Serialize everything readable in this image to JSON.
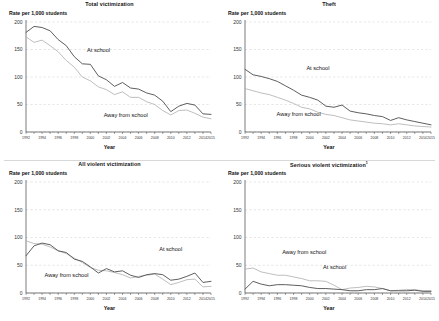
{
  "figure": {
    "series_names": [
      "At school",
      "Away from school"
    ],
    "colors": {
      "at_school": "#555555",
      "away_from_school": "#b2b2b2",
      "grid": "#cccccc",
      "axis": "#444444"
    },
    "footnote_marker": "1"
  },
  "chart_data": [
    {
      "type": "line",
      "title": "Total victimization",
      "ylabel": "Rate per 1,000 students",
      "xlabel": "Year",
      "ylim": [
        0,
        200
      ],
      "yticks": [
        0,
        50,
        100,
        150,
        200
      ],
      "grid": true,
      "legend": "inline-annotations",
      "x": [
        1992,
        1993,
        1994,
        1995,
        1996,
        1997,
        1998,
        1999,
        2000,
        2001,
        2002,
        2003,
        2004,
        2005,
        2006,
        2007,
        2008,
        2009,
        2010,
        2011,
        2012,
        2013,
        2014,
        2015
      ],
      "xticklabels": [
        "1992",
        "1994",
        "1996",
        "1998",
        "2000",
        "2002",
        "2004",
        "2006",
        "2008",
        "2010",
        "2012",
        "2014",
        "2015"
      ],
      "series": [
        {
          "name": "At school",
          "values": [
            181,
            192,
            190,
            184,
            168,
            157,
            137,
            124,
            123,
            102,
            95,
            83,
            90,
            80,
            78,
            71,
            67,
            56,
            37,
            47,
            52,
            49,
            33,
            32
          ]
        },
        {
          "name": "Away from school",
          "values": [
            173,
            163,
            167,
            157,
            146,
            130,
            118,
            100,
            93,
            82,
            77,
            68,
            73,
            63,
            63,
            55,
            50,
            39,
            31,
            39,
            40,
            34,
            27,
            24
          ]
        }
      ]
    },
    {
      "type": "line",
      "title": "Theft",
      "ylabel": "Rate per 1,000 students",
      "xlabel": "Year",
      "ylim": [
        0,
        200
      ],
      "yticks": [
        0,
        50,
        100,
        150,
        200
      ],
      "grid": true,
      "legend": "inline-annotations",
      "x": [
        1992,
        1993,
        1994,
        1995,
        1996,
        1997,
        1998,
        1999,
        2000,
        2001,
        2002,
        2003,
        2004,
        2005,
        2006,
        2007,
        2008,
        2009,
        2010,
        2011,
        2012,
        2013,
        2014,
        2015
      ],
      "xticklabels": [
        "1992",
        "1994",
        "1996",
        "1998",
        "2000",
        "2002",
        "2004",
        "2006",
        "2008",
        "2010",
        "2012",
        "2014",
        "2015"
      ],
      "series": [
        {
          "name": "At school",
          "values": [
            114,
            104,
            101,
            97,
            92,
            84,
            76,
            67,
            63,
            58,
            47,
            45,
            49,
            38,
            35,
            33,
            30,
            28,
            21,
            26,
            22,
            19,
            16,
            13
          ]
        },
        {
          "name": "Away from school",
          "values": [
            79,
            75,
            71,
            68,
            63,
            58,
            52,
            45,
            42,
            36,
            32,
            30,
            26,
            22,
            20,
            18,
            16,
            15,
            13,
            15,
            13,
            11,
            10,
            9
          ]
        }
      ]
    },
    {
      "type": "line",
      "title": "All violent victimization",
      "ylabel": "Rate per 1,000 students",
      "xlabel": "Year",
      "ylim": [
        0,
        200
      ],
      "yticks": [
        0,
        50,
        100,
        150,
        200
      ],
      "grid": true,
      "legend": "inline-annotations",
      "x": [
        1992,
        1993,
        1994,
        1995,
        1996,
        1997,
        1998,
        1999,
        2000,
        2001,
        2002,
        2003,
        2004,
        2005,
        2006,
        2007,
        2008,
        2009,
        2010,
        2011,
        2012,
        2013,
        2014,
        2015
      ],
      "xticklabels": [
        "1992",
        "1994",
        "1996",
        "1998",
        "2000",
        "2002",
        "2004",
        "2006",
        "2008",
        "2010",
        "2012",
        "2014",
        "2015"
      ],
      "series": [
        {
          "name": "At school",
          "values": [
            67,
            85,
            90,
            87,
            76,
            73,
            61,
            57,
            47,
            36,
            44,
            38,
            40,
            32,
            28,
            33,
            35,
            33,
            23,
            25,
            30,
            36,
            19,
            21
          ]
        },
        {
          "name": "Away from school",
          "values": [
            94,
            89,
            88,
            83,
            76,
            71,
            63,
            55,
            46,
            41,
            40,
            37,
            33,
            27,
            30,
            32,
            34,
            25,
            15,
            19,
            24,
            25,
            11,
            12
          ]
        }
      ]
    },
    {
      "type": "line",
      "title": "Serious violent victimization",
      "title_footnote": "1",
      "ylabel": "Rate per 1,000 students",
      "xlabel": "Year",
      "ylim": [
        0,
        200
      ],
      "yticks": [
        0,
        50,
        100,
        150,
        200
      ],
      "grid": true,
      "legend": "inline-annotations",
      "x": [
        1992,
        1993,
        1994,
        1995,
        1996,
        1997,
        1998,
        1999,
        2000,
        2001,
        2002,
        2003,
        2004,
        2005,
        2006,
        2007,
        2008,
        2009,
        2010,
        2011,
        2012,
        2013,
        2014,
        2015
      ],
      "xticklabels": [
        "1992",
        "1994",
        "1996",
        "1998",
        "2000",
        "2002",
        "2004",
        "2006",
        "2008",
        "2010",
        "2012",
        "2014",
        "2015"
      ],
      "series": [
        {
          "name": "At school",
          "values": [
            7,
            21,
            16,
            13,
            15,
            15,
            14,
            13,
            10,
            8,
            8,
            7,
            6,
            4,
            4,
            6,
            6,
            8,
            4,
            4,
            4,
            5,
            3,
            3
          ]
        },
        {
          "name": "Away from school",
          "values": [
            43,
            45,
            38,
            35,
            32,
            32,
            29,
            26,
            22,
            22,
            21,
            14,
            6,
            9,
            10,
            12,
            11,
            8,
            4,
            5,
            6,
            6,
            4,
            4
          ]
        }
      ]
    }
  ],
  "panels": [
    {
      "id": "total-victimization",
      "title": "Total victimization",
      "ylabel": "Rate per 1,000 students",
      "xlabel": "Year",
      "annotations": [
        {
          "text": "At school",
          "x": 0.33,
          "y": 0.27
        },
        {
          "text": "Away from school",
          "x": 0.42,
          "y": 0.86
        }
      ]
    },
    {
      "id": "theft",
      "title": "Theft",
      "ylabel": "Rate per 1,000 students",
      "xlabel": "Year",
      "annotations": [
        {
          "text": "At school",
          "x": 0.33,
          "y": 0.44
        },
        {
          "text": "Away from school",
          "x": 0.17,
          "y": 0.85
        }
      ]
    },
    {
      "id": "all-violent",
      "title": "All violent victimization",
      "ylabel": "Rate per 1,000 students",
      "xlabel": "Year",
      "annotations": [
        {
          "text": "At school",
          "x": 0.72,
          "y": 0.62
        },
        {
          "text": "Away from school",
          "x": 0.1,
          "y": 0.86
        }
      ]
    },
    {
      "id": "serious-violent",
      "title": "Serious violent victimization",
      "ylabel": "Rate per 1,000 students",
      "xlabel": "Year",
      "annotations": [
        {
          "text": "Away from school",
          "x": 0.2,
          "y": 0.65
        },
        {
          "text": "At school",
          "x": 0.42,
          "y": 0.78
        }
      ]
    }
  ]
}
